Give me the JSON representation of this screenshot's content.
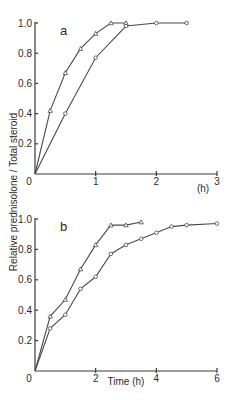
{
  "chart_data": [
    {
      "type": "line",
      "panel_label": "a",
      "xlabel": "(h)",
      "ylabel": "Relative prednisolone / Total steroid",
      "xlim": [
        0,
        3
      ],
      "ylim": [
        0,
        1.0
      ],
      "xticks": [
        "0",
        "1",
        "2",
        "3"
      ],
      "yticks": [
        "0.2",
        "0.4",
        "0.6",
        "0.8",
        "1.0"
      ],
      "series": [
        {
          "name": "triangle",
          "marker": "triangle",
          "x": [
            0,
            0.25,
            0.5,
            0.75,
            1.0,
            1.25,
            1.5
          ],
          "y": [
            0,
            0.42,
            0.67,
            0.83,
            0.93,
            1.0,
            1.0
          ]
        },
        {
          "name": "circle",
          "marker": "circle",
          "x": [
            0,
            0.5,
            1.0,
            1.5,
            2.0,
            2.5
          ],
          "y": [
            0,
            0.4,
            0.77,
            0.98,
            1.0,
            1.0
          ]
        }
      ]
    },
    {
      "type": "line",
      "panel_label": "b",
      "xlabel": "Time (h)",
      "ylabel": "Relative prednisolone / Total steroid",
      "xlim": [
        0,
        6
      ],
      "ylim": [
        0,
        1.0
      ],
      "xticks": [
        "0",
        "2",
        "4",
        "6"
      ],
      "yticks": [
        "0.2",
        "0.4",
        "0.6",
        "0.8",
        "1.0"
      ],
      "series": [
        {
          "name": "triangle",
          "marker": "triangle",
          "x": [
            0,
            0.5,
            1.0,
            1.5,
            2.0,
            2.5,
            3.0,
            3.5
          ],
          "y": [
            0,
            0.36,
            0.47,
            0.67,
            0.83,
            0.96,
            0.96,
            0.98
          ]
        },
        {
          "name": "circle",
          "marker": "circle",
          "x": [
            0,
            0.5,
            1.0,
            1.5,
            2.0,
            2.5,
            3.0,
            3.5,
            4.0,
            4.5,
            5.0,
            6.0
          ],
          "y": [
            0,
            0.28,
            0.37,
            0.54,
            0.62,
            0.77,
            0.83,
            0.87,
            0.91,
            0.95,
            0.96,
            0.97
          ]
        }
      ]
    }
  ],
  "labels": {
    "ylabel": "Relative prednisolone / Total steroid",
    "origin_a": "0",
    "origin_b": "0"
  }
}
